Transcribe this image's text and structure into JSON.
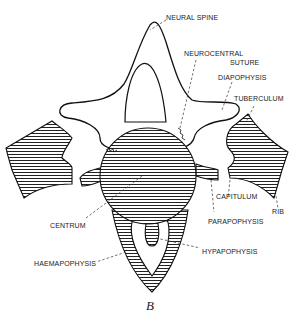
{
  "figure": {
    "caption": "B",
    "colors": {
      "line": "#111111",
      "background": "#ffffff",
      "hatch": "#222222"
    }
  },
  "labels": [
    {
      "id": "neural-spine",
      "text": "NEURAL SPINE"
    },
    {
      "id": "neurocentral-suture-1",
      "text": "NEUROCENTRAL"
    },
    {
      "id": "neurocentral-suture-2",
      "text": "SUTURE"
    },
    {
      "id": "diapophysis",
      "text": "DIAPOPHYSIS"
    },
    {
      "id": "tuberculum",
      "text": "TUBERCULUM"
    },
    {
      "id": "capitulum",
      "text": "CAPITULUM"
    },
    {
      "id": "rib",
      "text": "RIB"
    },
    {
      "id": "parapophysis",
      "text": "PARAPOPHYSIS"
    },
    {
      "id": "centrum",
      "text": "CENTRUM"
    },
    {
      "id": "hypapophysis",
      "text": "HYPAPOPHYSIS"
    },
    {
      "id": "haemapophysis",
      "text": "HAEMAPOPHYSIS"
    }
  ]
}
